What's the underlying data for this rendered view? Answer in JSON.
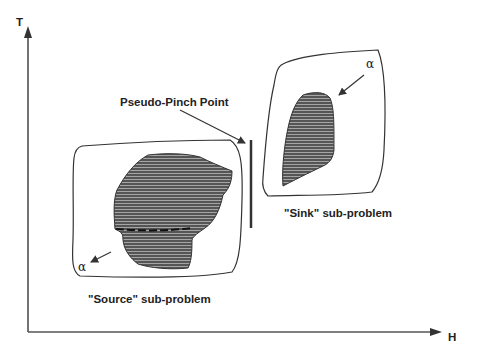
{
  "axes": {
    "y_label": "T",
    "x_label": "H"
  },
  "labels": {
    "pinch": "Pseudo-Pinch Point",
    "sink": "\"Sink\" sub-problem",
    "source": "\"Source\" sub-problem",
    "alpha_sink": "α",
    "alpha_source": "α"
  },
  "colors": {
    "line": "#333333",
    "fill": "#5a5a5a",
    "hatch": "#9a9a9a"
  }
}
